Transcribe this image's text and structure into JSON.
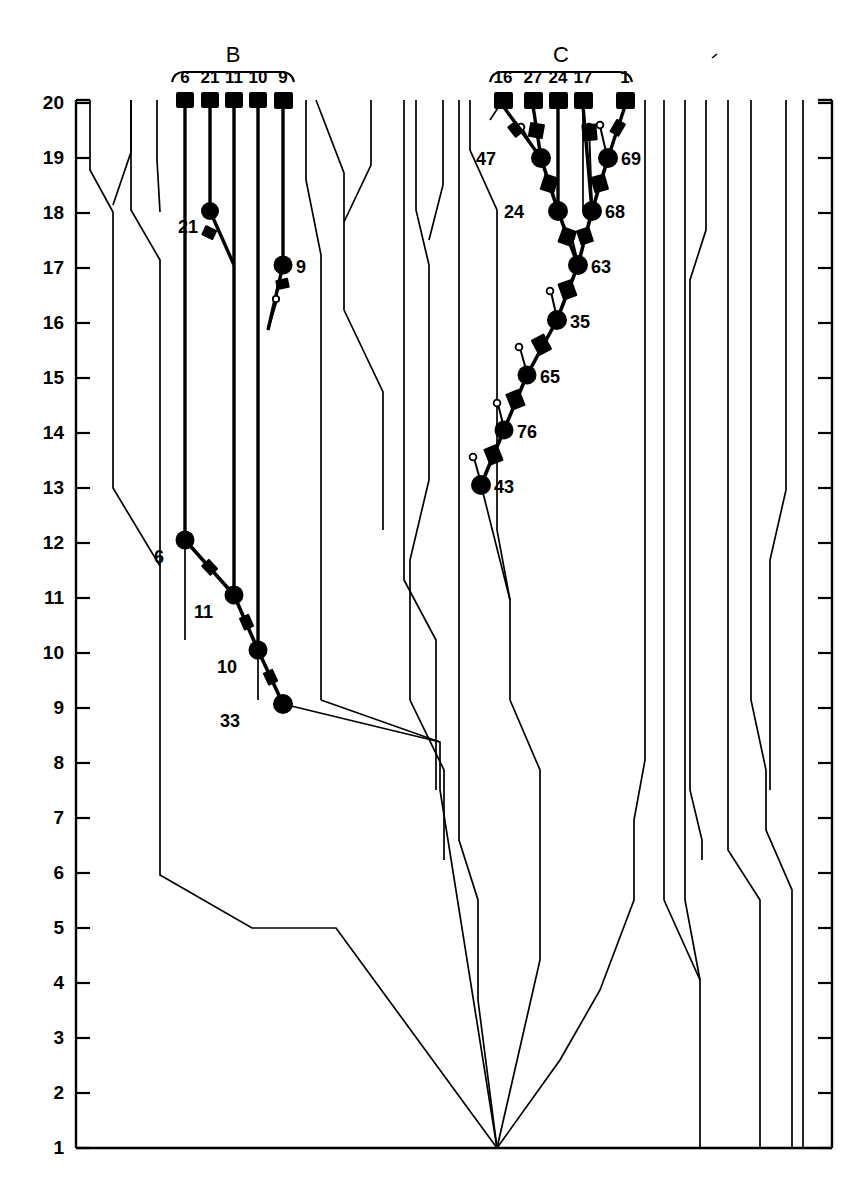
{
  "figure": {
    "type": "lineage-tree-diagram",
    "background_color": "#ffffff",
    "line_color": "#000000",
    "heavy_color": "#000000"
  },
  "axis": {
    "name": "vertical-level-axis",
    "orientation": "vertical",
    "min": 1,
    "max": 20,
    "ticks": [
      20,
      19,
      18,
      17,
      16,
      15,
      14,
      13,
      12,
      11,
      10,
      9,
      8,
      7,
      6,
      5,
      4,
      3,
      2,
      1
    ],
    "tick_labels": [
      "20",
      "19",
      "18",
      "17",
      "16",
      "15",
      "14",
      "13",
      "12",
      "11",
      "10",
      "9",
      "8",
      "7",
      "6",
      "5",
      "4",
      "3",
      "2",
      "1"
    ]
  },
  "groups": [
    {
      "id": "B",
      "label": "B",
      "bracket_label": "B",
      "tips": [
        "6",
        "21",
        "11",
        "10",
        "9"
      ]
    },
    {
      "id": "C",
      "label": "C",
      "bracket_label": "C",
      "tips": [
        "16",
        "27",
        "24",
        "17",
        "1"
      ]
    }
  ],
  "nodes": {
    "clade_B": [
      {
        "label": "21",
        "level": 18,
        "side": "left"
      },
      {
        "label": "9",
        "level": 17,
        "side": "right"
      },
      {
        "label": "6",
        "level": 12,
        "side": "left"
      },
      {
        "label": "11",
        "level": 11,
        "side": "left"
      },
      {
        "label": "10",
        "level": 10,
        "side": "left"
      },
      {
        "label": "33",
        "level": 9,
        "side": "left"
      }
    ],
    "clade_C": [
      {
        "label": "47",
        "level": 19,
        "side": "left"
      },
      {
        "label": "69",
        "level": 19,
        "side": "right"
      },
      {
        "label": "24",
        "level": 18,
        "side": "left"
      },
      {
        "label": "68",
        "level": 18,
        "side": "right"
      },
      {
        "label": "63",
        "level": 17,
        "side": "right"
      },
      {
        "label": "35",
        "level": 16,
        "side": "right"
      },
      {
        "label": "65",
        "level": 15,
        "side": "right"
      },
      {
        "label": "76",
        "level": 14,
        "side": "right"
      },
      {
        "label": "43",
        "level": 13,
        "side": "right"
      }
    ]
  },
  "chart_data": {
    "type": "line",
    "title": "",
    "xlabel": "",
    "ylabel": "",
    "ylim": [
      1,
      20
    ],
    "grid": false,
    "legend": "none",
    "series": [
      {
        "name": "clade-B-lineage",
        "nodes": [
          "6",
          "11",
          "10",
          "33"
        ],
        "levels": [
          12,
          11,
          10,
          9
        ]
      },
      {
        "name": "clade-B-tips",
        "nodes": [
          "6",
          "21",
          "11",
          "10",
          "9"
        ],
        "levels": [
          20,
          20,
          20,
          20,
          20
        ]
      },
      {
        "name": "clade-C-lineage",
        "nodes": [
          "63",
          "35",
          "65",
          "76",
          "43"
        ],
        "levels": [
          17,
          16,
          15,
          14,
          13
        ]
      },
      {
        "name": "clade-C-upper",
        "nodes": [
          "47",
          "69",
          "24",
          "68"
        ],
        "levels": [
          19,
          19,
          18,
          18
        ]
      },
      {
        "name": "clade-C-tips",
        "nodes": [
          "16",
          "27",
          "24",
          "17",
          "1"
        ],
        "levels": [
          20,
          20,
          20,
          20,
          20
        ]
      }
    ]
  }
}
